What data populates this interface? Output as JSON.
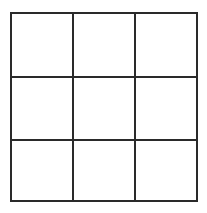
{
  "board": {
    "rows": 3,
    "cols": 3,
    "line_color": "#2a2a2a",
    "background": "#ffffff",
    "cells": [
      "",
      "",
      "",
      "",
      "",
      "",
      "",
      "",
      ""
    ]
  }
}
